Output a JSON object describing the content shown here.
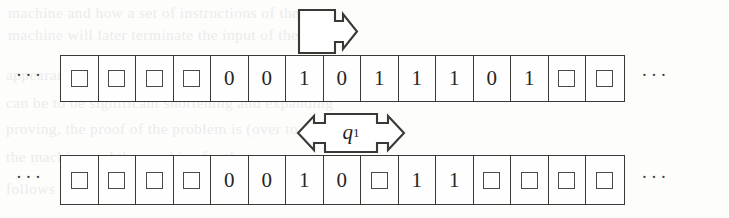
{
  "figure": {
    "kind": "turing-machine-tape-diagram",
    "blank_symbol_name": "blank-square",
    "ellipsis_text": "···",
    "ink_color": "#3a3936",
    "paper_color": "#fdfdfc",
    "ghost_text_color": "#ececea"
  },
  "head": {
    "name": "read-write-head",
    "direction": "right",
    "icon": "rectangle-with-right-arrow-icon",
    "over_cell_index": 7
  },
  "state": {
    "name": "machine-state",
    "label": "q",
    "subscript": "1",
    "left_icon": "chevron-left-arrow-icon",
    "right_icon": "chevron-right-arrow-icon"
  },
  "tapes": [
    {
      "id": "top",
      "name": "upper-tape",
      "ellipsis_left": "···",
      "ellipsis_right": "···",
      "cells": [
        {
          "value": "",
          "blank": true
        },
        {
          "value": "",
          "blank": true
        },
        {
          "value": "",
          "blank": true
        },
        {
          "value": "",
          "blank": true
        },
        {
          "value": "0",
          "blank": false
        },
        {
          "value": "0",
          "blank": false
        },
        {
          "value": "1",
          "blank": false
        },
        {
          "value": "0",
          "blank": false
        },
        {
          "value": "1",
          "blank": false
        },
        {
          "value": "1",
          "blank": false
        },
        {
          "value": "1",
          "blank": false
        },
        {
          "value": "0",
          "blank": false
        },
        {
          "value": "1",
          "blank": false
        },
        {
          "value": "",
          "blank": true
        },
        {
          "value": "",
          "blank": true
        }
      ]
    },
    {
      "id": "bottom",
      "name": "lower-tape",
      "ellipsis_left": "···",
      "ellipsis_right": "···",
      "cells": [
        {
          "value": "",
          "blank": true
        },
        {
          "value": "",
          "blank": true
        },
        {
          "value": "",
          "blank": true
        },
        {
          "value": "",
          "blank": true
        },
        {
          "value": "0",
          "blank": false
        },
        {
          "value": "0",
          "blank": false
        },
        {
          "value": "1",
          "blank": false
        },
        {
          "value": "0",
          "blank": false
        },
        {
          "value": "",
          "blank": true
        },
        {
          "value": "1",
          "blank": false
        },
        {
          "value": "1",
          "blank": false
        },
        {
          "value": "",
          "blank": true
        },
        {
          "value": "",
          "blank": true
        },
        {
          "value": "",
          "blank": true
        },
        {
          "value": "",
          "blank": true
        }
      ]
    }
  ],
  "background_text": {
    "name": "page-bleed-through",
    "lines": [
      {
        "text": "machine and how a set of instructions of the",
        "x": 8,
        "y": 4
      },
      {
        "text": "machine will later terminate the input of the",
        "x": 8,
        "y": 26
      },
      {
        "text": "appearance of the string as the end of the end",
        "x": 6,
        "y": 66
      },
      {
        "text": "can be to be significant shortening and expanding",
        "x": 6,
        "y": 94
      },
      {
        "text": "proving, the proof of the problem is (over to see",
        "x": 6,
        "y": 120
      },
      {
        "text": "the machine and the machine for the",
        "x": 6,
        "y": 148
      },
      {
        "text": "follows from the following of the problem for",
        "x": 6,
        "y": 180
      }
    ]
  }
}
